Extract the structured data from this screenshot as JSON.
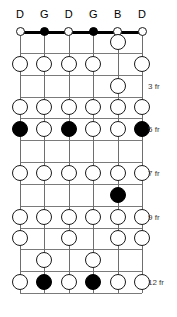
{
  "diagram": {
    "type": "guitar-fretboard",
    "string_count": 6,
    "fret_count": 12,
    "tuning_labels": [
      "D",
      "G",
      "D",
      "G",
      "B",
      "D"
    ],
    "fret_markers": [
      {
        "fret": 3,
        "label": "3 fr"
      },
      {
        "fret": 5,
        "label": "5 fr"
      },
      {
        "fret": 7,
        "label": "7 fr"
      },
      {
        "fret": 9,
        "label": "9 fr"
      },
      {
        "fret": 12,
        "label": "12 fr"
      }
    ],
    "colors": {
      "root_fill": "#000000",
      "note_fill": "#ffffff",
      "outline": "#1a1a1a",
      "fretline": "#7a7a7a",
      "stringline": "#6e6e6e",
      "nut": "#000000",
      "text": "#000000",
      "marker_text": "#3d3d3d",
      "background": "#ffffff"
    },
    "open_notes": [
      {
        "string": 1,
        "style": "hollow"
      },
      {
        "string": 2,
        "style": "filled"
      },
      {
        "string": 3,
        "style": "hollow"
      },
      {
        "string": 4,
        "style": "filled"
      },
      {
        "string": 5,
        "style": "hollow"
      },
      {
        "string": 6,
        "style": "hollow"
      }
    ],
    "fretted_notes": [
      {
        "fret": 1,
        "string": 5,
        "style": "hollow"
      },
      {
        "fret": 2,
        "string": 1,
        "style": "hollow"
      },
      {
        "fret": 2,
        "string": 2,
        "style": "hollow"
      },
      {
        "fret": 2,
        "string": 3,
        "style": "hollow"
      },
      {
        "fret": 2,
        "string": 4,
        "style": "hollow"
      },
      {
        "fret": 2,
        "string": 6,
        "style": "hollow"
      },
      {
        "fret": 3,
        "string": 5,
        "style": "hollow"
      },
      {
        "fret": 4,
        "string": 1,
        "style": "hollow"
      },
      {
        "fret": 4,
        "string": 2,
        "style": "hollow"
      },
      {
        "fret": 4,
        "string": 3,
        "style": "hollow"
      },
      {
        "fret": 4,
        "string": 4,
        "style": "hollow"
      },
      {
        "fret": 4,
        "string": 5,
        "style": "hollow"
      },
      {
        "fret": 4,
        "string": 6,
        "style": "hollow"
      },
      {
        "fret": 5,
        "string": 1,
        "style": "filled"
      },
      {
        "fret": 5,
        "string": 2,
        "style": "hollow"
      },
      {
        "fret": 5,
        "string": 3,
        "style": "filled"
      },
      {
        "fret": 5,
        "string": 4,
        "style": "hollow"
      },
      {
        "fret": 5,
        "string": 5,
        "style": "hollow"
      },
      {
        "fret": 5,
        "string": 6,
        "style": "filled"
      },
      {
        "fret": 7,
        "string": 1,
        "style": "hollow"
      },
      {
        "fret": 7,
        "string": 2,
        "style": "hollow"
      },
      {
        "fret": 7,
        "string": 3,
        "style": "hollow"
      },
      {
        "fret": 7,
        "string": 4,
        "style": "hollow"
      },
      {
        "fret": 7,
        "string": 5,
        "style": "hollow"
      },
      {
        "fret": 7,
        "string": 6,
        "style": "hollow"
      },
      {
        "fret": 8,
        "string": 5,
        "style": "filled"
      },
      {
        "fret": 9,
        "string": 1,
        "style": "hollow"
      },
      {
        "fret": 9,
        "string": 2,
        "style": "hollow"
      },
      {
        "fret": 9,
        "string": 3,
        "style": "hollow"
      },
      {
        "fret": 9,
        "string": 4,
        "style": "hollow"
      },
      {
        "fret": 9,
        "string": 5,
        "style": "hollow"
      },
      {
        "fret": 9,
        "string": 6,
        "style": "hollow"
      },
      {
        "fret": 10,
        "string": 1,
        "style": "hollow"
      },
      {
        "fret": 10,
        "string": 3,
        "style": "hollow"
      },
      {
        "fret": 10,
        "string": 5,
        "style": "hollow"
      },
      {
        "fret": 10,
        "string": 6,
        "style": "hollow"
      },
      {
        "fret": 11,
        "string": 2,
        "style": "hollow"
      },
      {
        "fret": 11,
        "string": 4,
        "style": "hollow"
      },
      {
        "fret": 12,
        "string": 1,
        "style": "hollow"
      },
      {
        "fret": 12,
        "string": 2,
        "style": "filled"
      },
      {
        "fret": 12,
        "string": 3,
        "style": "hollow"
      },
      {
        "fret": 12,
        "string": 4,
        "style": "filled"
      },
      {
        "fret": 12,
        "string": 5,
        "style": "hollow"
      },
      {
        "fret": 12,
        "string": 6,
        "style": "hollow"
      }
    ]
  }
}
